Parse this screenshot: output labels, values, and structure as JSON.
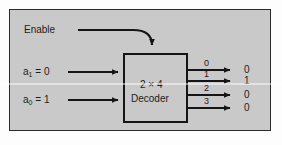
{
  "figure": {
    "panel_color": "#c9c9c9",
    "line_color": "#151515",
    "text_color": "#1c1c1c",
    "background_color": "#fdfdfd"
  },
  "enable": {
    "label": "Enable"
  },
  "inputs": [
    {
      "name": "a1",
      "base": "a",
      "subscript": "1",
      "equals": "=",
      "value": "0",
      "label": "a₁ = 0"
    },
    {
      "name": "a0",
      "base": "a",
      "subscript": "0",
      "equals": "=",
      "value": "1",
      "label": "a₀ = 1"
    }
  ],
  "block": {
    "line1": "2 × 4",
    "line2": "Decoder"
  },
  "outputs": [
    {
      "index": "0",
      "value": "0",
      "active": false
    },
    {
      "index": "1",
      "value": "1",
      "active": true
    },
    {
      "index": "2",
      "value": "0",
      "active": false
    },
    {
      "index": "3",
      "value": "0",
      "active": false
    }
  ]
}
